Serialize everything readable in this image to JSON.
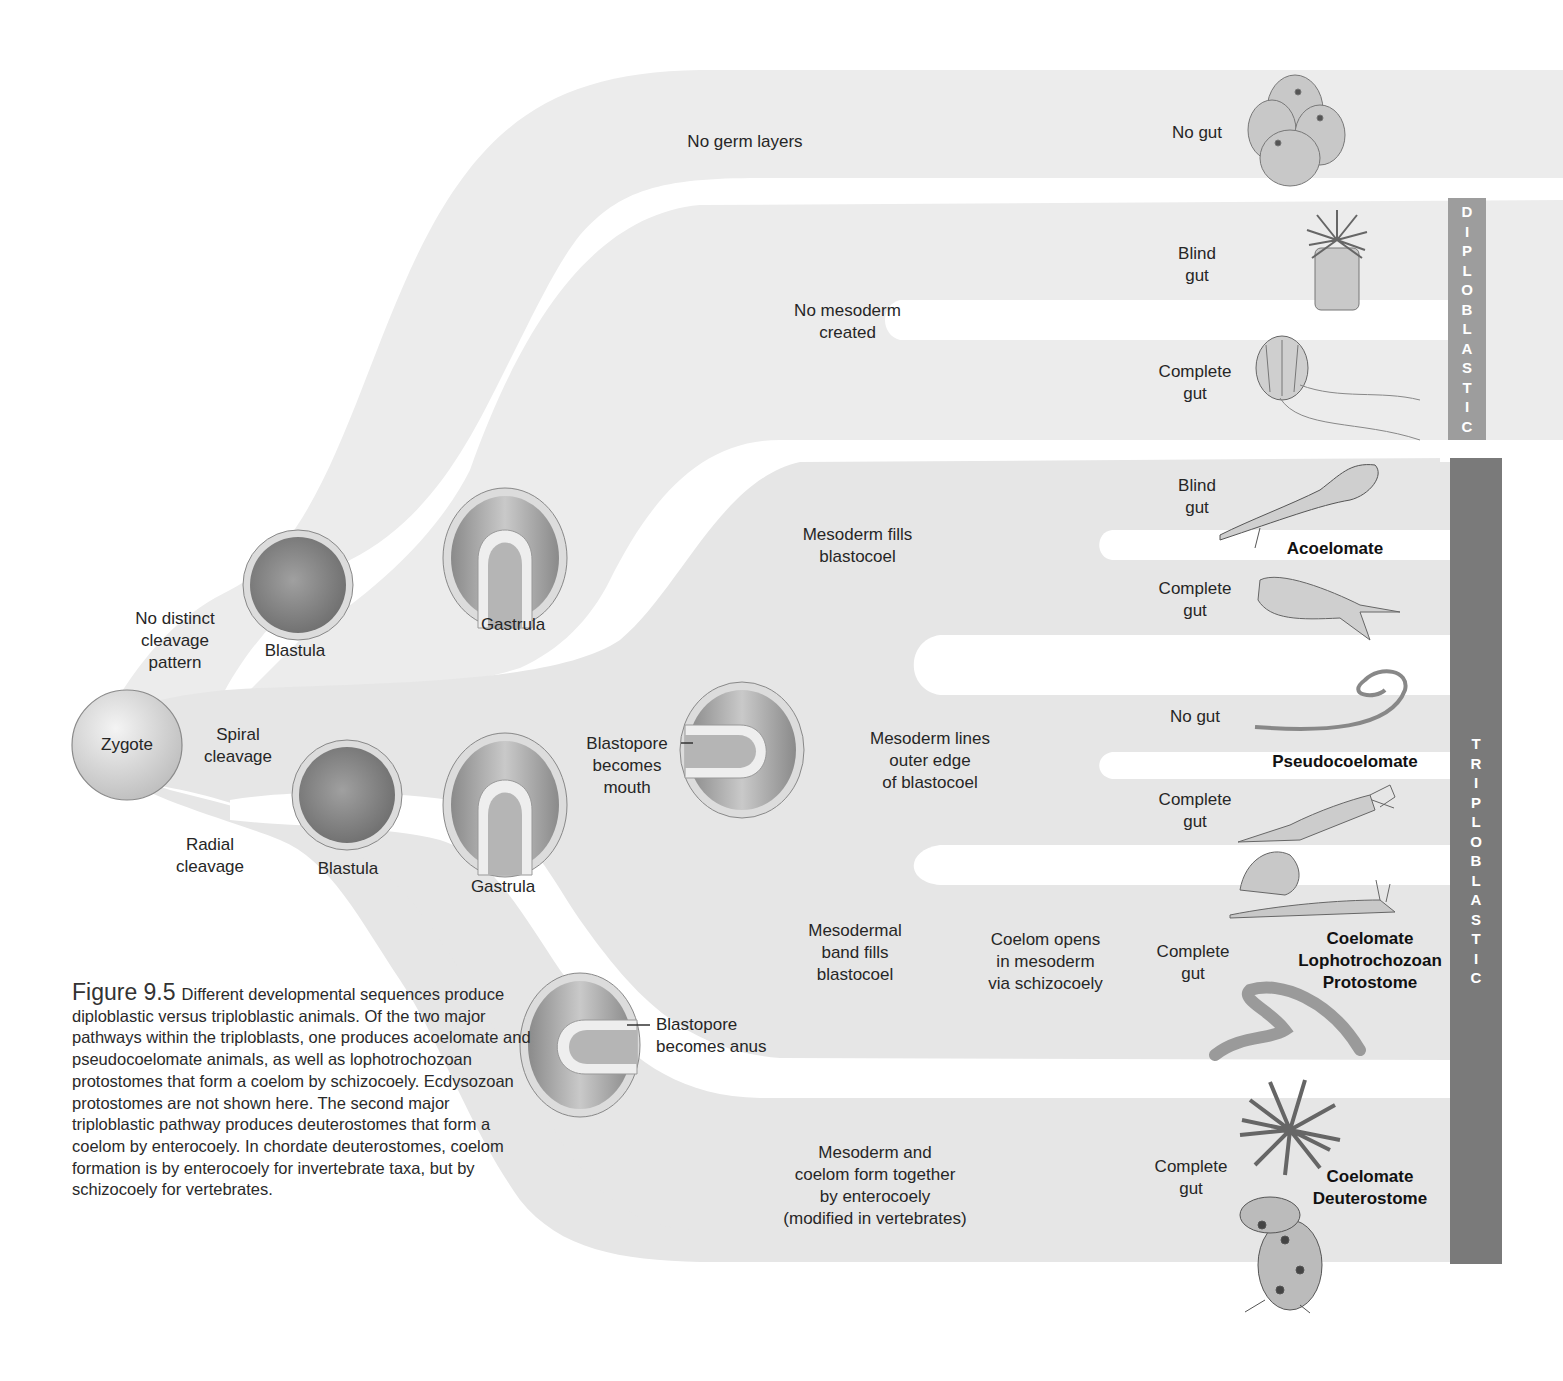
{
  "figure": {
    "number": "Figure 9.5",
    "caption": "Different developmental sequences produce diploblastic versus triploblastic animals. Of the two major pathways within the triploblasts, one produces acoelomate and pseudocoelomate animals, as well as lophotrochozoan protostomes that form a coelom by schizocoely. Ecdysozoan protostomes are not shown here. The second major triploblastic pathway produces deuterostomes that form a coelom by enterocoely. In chordate deuterostomes, coelom formation is by enterocoely for invertebrate taxa, but by schizocoely for vertebrates."
  },
  "colors": {
    "band_light": "#ececec",
    "band_mid": "#e0e0e0",
    "bar_diploblastic": "#9d9d9d",
    "bar_triploblastic": "#7a7a7a",
    "text": "#262626"
  },
  "start": {
    "zygote": "Zygote"
  },
  "cleavage": {
    "no_distinct": [
      "No distinct",
      "cleavage",
      "pattern"
    ],
    "spiral": [
      "Spiral",
      "cleavage"
    ],
    "radial": [
      "Radial",
      "cleavage"
    ]
  },
  "stages": {
    "blastula_top": "Blastula",
    "gastrula_top": "Gastrula",
    "blastula_bottom": "Blastula",
    "gastrula_bottom": "Gastrula",
    "blastopore_mouth": [
      "Blastopore",
      "becomes",
      "mouth"
    ],
    "blastopore_anus": [
      "Blastopore",
      "becomes anus"
    ]
  },
  "pathways": {
    "no_germ_layers": "No germ layers",
    "no_mesoderm": [
      "No mesoderm",
      "created"
    ],
    "mesoderm_fills": [
      "Mesoderm fills",
      "blastocoel"
    ],
    "mesoderm_lines": [
      "Mesoderm lines",
      "outer edge",
      "of blastocoel"
    ],
    "mesodermal_band": [
      "Mesodermal",
      "band fills",
      "blastocoel"
    ],
    "coelom_opens": [
      "Coelom opens",
      "in mesoderm",
      "via schizocoely"
    ],
    "enterocoely": [
      "Mesoderm and",
      "coelom form together",
      "by enterocoely",
      "(modified in vertebrates)"
    ]
  },
  "outcomes": [
    {
      "gut": [
        "No gut"
      ],
      "animal": "sponge-illustration"
    },
    {
      "gut": [
        "Blind",
        "gut"
      ],
      "animal": "sea-anemone-illustration"
    },
    {
      "gut": [
        "Complete",
        "gut"
      ],
      "animal": "comb-jelly-illustration"
    },
    {
      "gut": [
        "Blind",
        "gut"
      ],
      "animal": "flatworm-illustration"
    },
    {
      "gut": [
        "Complete",
        "gut"
      ],
      "animal": "ribbon-worm-illustration"
    },
    {
      "gut": [
        "No gut"
      ],
      "animal": "horsehair-worm-illustration"
    },
    {
      "gut": [
        "Complete",
        "gut"
      ],
      "animal": "rotifer-illustration"
    },
    {
      "gut": [
        "Complete",
        "gut"
      ],
      "animal": "snail-earthworm-illustration"
    },
    {
      "gut": [
        "Complete",
        "gut"
      ],
      "animal": "sea-urchin-frog-illustration"
    }
  ],
  "groups": {
    "acoelomate": "Acoelomate",
    "pseudocoelomate": "Pseudocoelomate",
    "lophotrochozoan": [
      "Coelomate",
      "Lophotrochozoan",
      "Protostome"
    ],
    "deuterostome": [
      "Coelomate",
      "Deuterostome"
    ]
  },
  "bars": {
    "diploblastic": [
      "D",
      "I",
      "P",
      "L",
      "O",
      "B",
      "L",
      "A",
      "S",
      "T",
      "I",
      "C"
    ],
    "triploblastic": [
      "T",
      "R",
      "I",
      "P",
      "L",
      "O",
      "B",
      "L",
      "A",
      "S",
      "T",
      "I",
      "C"
    ]
  }
}
